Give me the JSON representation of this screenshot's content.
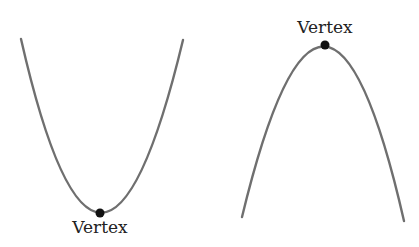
{
  "diagram": {
    "colors": {
      "curve": "#6f6f6f",
      "vertex_dot": "#111111",
      "text": "#222222",
      "background": "#ffffff"
    },
    "parabolas": [
      {
        "orientation": "opens-up",
        "vertex_label": "Vertex",
        "label_position": "below-vertex"
      },
      {
        "orientation": "opens-down",
        "vertex_label": "Vertex",
        "label_position": "above-vertex"
      }
    ]
  }
}
